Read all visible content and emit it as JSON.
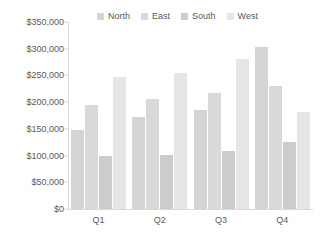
{
  "chart_data": {
    "type": "bar",
    "title": "",
    "subtitle": "",
    "xlabel": "",
    "ylabel": "",
    "categories": [
      "Q1",
      "Q2",
      "Q3",
      "Q4"
    ],
    "series": [
      {
        "name": "North",
        "color": "#d4d4d4",
        "values": [
          148000,
          172000,
          185000,
          303000
        ]
      },
      {
        "name": "East",
        "color": "#d9d9d9",
        "values": [
          195000,
          205000,
          218000,
          230000
        ]
      },
      {
        "name": "South",
        "color": "#cccccc",
        "values": [
          100000,
          102000,
          109000,
          125000
        ]
      },
      {
        "name": "West",
        "color": "#e6e6e6",
        "values": [
          247000,
          255000,
          280000,
          182000
        ]
      }
    ],
    "ylim": [
      0,
      350000
    ],
    "ytick_step": 50000,
    "ytick_labels": [
      "$0",
      "$50,000",
      "$100,000",
      "$150,000",
      "$200,000",
      "$250,000",
      "$300,000",
      "$350,000"
    ],
    "ytick_values": [
      0,
      50000,
      100000,
      150000,
      200000,
      250000,
      300000,
      350000
    ],
    "grid": false,
    "legend_position": "top",
    "axis_color": "#d9d9d9",
    "text_color": "#595959",
    "background": "#ffffff"
  },
  "legend": {
    "items": [
      {
        "label": "North"
      },
      {
        "label": "East"
      },
      {
        "label": "South"
      },
      {
        "label": "West"
      }
    ]
  }
}
